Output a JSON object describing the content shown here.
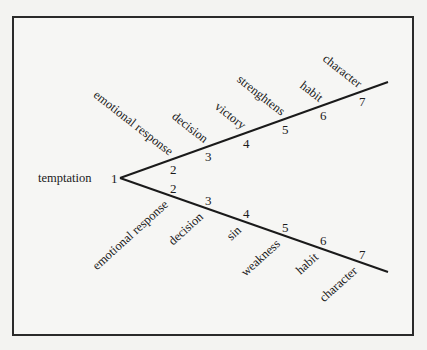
{
  "diagram": {
    "start_label": "temptation",
    "start_number": "1",
    "vertex": [
      120,
      178
    ],
    "upper_branch": {
      "end": [
        388,
        82
      ],
      "steps": [
        {
          "number": "2",
          "label": "emotional response"
        },
        {
          "number": "3",
          "label": "decision"
        },
        {
          "number": "4",
          "label": "victory"
        },
        {
          "number": "5",
          "label": "strenghtens"
        },
        {
          "number": "6",
          "label": "habit"
        },
        {
          "number": "7",
          "label": "character"
        }
      ]
    },
    "lower_branch": {
      "end": [
        388,
        272
      ],
      "steps": [
        {
          "number": "2",
          "label": "emotional response"
        },
        {
          "number": "3",
          "label": "decision"
        },
        {
          "number": "4",
          "label": "sin"
        },
        {
          "number": "5",
          "label": "weakness"
        },
        {
          "number": "6",
          "label": "habit"
        },
        {
          "number": "7",
          "label": "character"
        }
      ]
    },
    "colors": {
      "line": "#1a1a1a",
      "frame": "#2a2a2a",
      "background": "#f3f3f1"
    }
  }
}
